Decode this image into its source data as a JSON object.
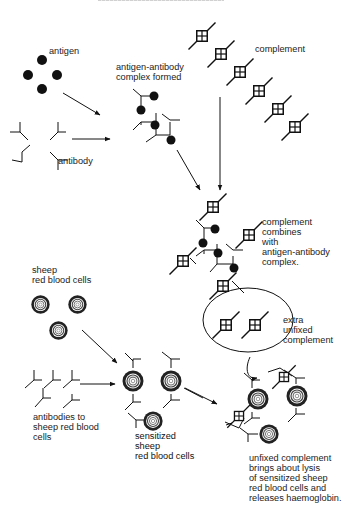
{
  "header": {
    "clipped_text": ""
  },
  "labels": {
    "antigen": "antigen",
    "antibody": "antibody",
    "complex_formed": "antigen-antibody\ncomplex formed",
    "complement": "complement",
    "complement_combines": "complement\ncombines\nwith\nantigen-antibody\ncomplex.",
    "extra_unfixed": "extra\nunfixed\ncomplement",
    "sheep_rbc": "sheep\nred blood cells",
    "antibodies_to_sheep": "antibodies to\nsheep red blood\ncells",
    "sensitized": "sensitized\nsheep\nred blood cells",
    "lysis": "unfixed complement\nbrings about lysis\nof sensitized sheep\nred blood cells and\nreleases haemoglobin."
  },
  "colors": {
    "ink": "#111111",
    "text": "#222222",
    "background": "#ffffff"
  }
}
